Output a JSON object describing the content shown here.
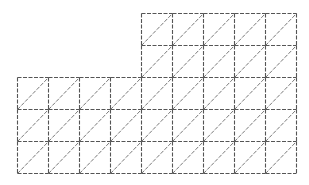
{
  "diagram": {
    "type": "triangulated-grid-mesh",
    "cell_width": 31,
    "cell_height": 32,
    "origin_x": 17,
    "origin_y": 13,
    "columns": 9,
    "rows": 5,
    "line_color": "#555555",
    "line_style": "dashed",
    "diagonal_direction": "bottom-left-to-top-right",
    "regions": [
      {
        "name": "upper-block",
        "col_start": 4,
        "col_end": 9,
        "row_start": 0,
        "row_end": 2
      },
      {
        "name": "lower-block",
        "col_start": 0,
        "col_end": 9,
        "row_start": 2,
        "row_end": 5
      }
    ]
  }
}
